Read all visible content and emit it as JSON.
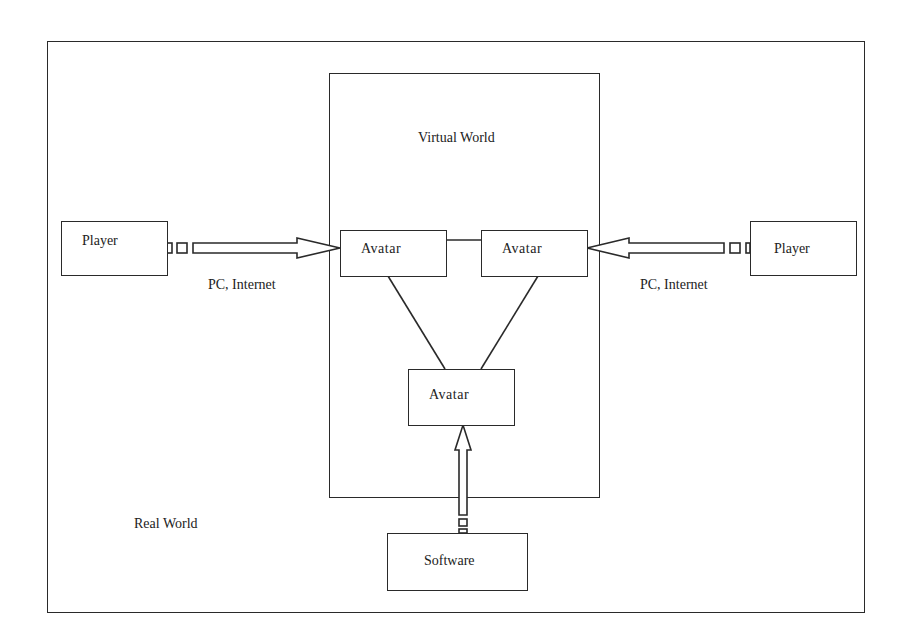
{
  "diagram": {
    "type": "block-diagram",
    "outer_frame": {
      "label": "Real World"
    },
    "virtual_world": {
      "label": "Virtual World"
    },
    "nodes": {
      "player_left": {
        "label": "Player"
      },
      "player_right": {
        "label": "Player"
      },
      "avatar_left": {
        "label": "Avatar"
      },
      "avatar_right": {
        "label": "Avatar"
      },
      "avatar_bottom": {
        "label": "Avatar"
      },
      "software": {
        "label": "Software"
      }
    },
    "connection_labels": {
      "left": "PC, Internet",
      "right": "PC, Internet"
    },
    "edges": [
      {
        "from": "player_left",
        "to": "avatar_left",
        "style": "hollow-arrow",
        "label": "PC, Internet"
      },
      {
        "from": "player_right",
        "to": "avatar_right",
        "style": "hollow-arrow",
        "label": "PC, Internet"
      },
      {
        "from": "software",
        "to": "avatar_bottom",
        "style": "hollow-arrow"
      },
      {
        "from": "avatar_left",
        "to": "avatar_right",
        "style": "line"
      },
      {
        "from": "avatar_left",
        "to": "avatar_bottom",
        "style": "line"
      },
      {
        "from": "avatar_right",
        "to": "avatar_bottom",
        "style": "line"
      }
    ],
    "colors": {
      "stroke": "#2a2a2a",
      "background": "#ffffff",
      "text": "#222222"
    }
  }
}
